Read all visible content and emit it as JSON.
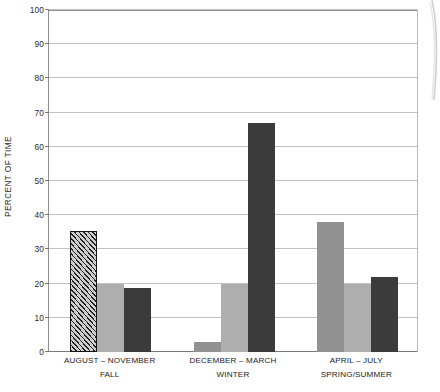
{
  "chart_data": {
    "type": "bar",
    "title": "",
    "subtitle": "",
    "xlabel": "",
    "ylabel": "PERCENT OF TIME",
    "ylim": [
      0,
      100
    ],
    "yticks": [
      0,
      10,
      20,
      30,
      40,
      50,
      60,
      70,
      80,
      90,
      100
    ],
    "ytick_labels": [
      "0",
      "10",
      "20",
      "30",
      "40",
      "50",
      "60",
      "70",
      "80",
      "90",
      "100"
    ],
    "grid": true,
    "legend": "none",
    "categories": [
      "AUGUST – NOVEMBER",
      "DECEMBER – MARCH",
      "APRIL – JULY"
    ],
    "category_sublabels": [
      "FALL",
      "WINTER",
      "SPRING/SUMMER"
    ],
    "series": [
      {
        "name": "series-1",
        "values": [
          35.5,
          3.0,
          38.0
        ],
        "styles": [
          "hatched",
          "medium-gray",
          "medium-gray"
        ],
        "colors": [
          "#b3b3b3",
          "#919191",
          "#919191"
        ]
      },
      {
        "name": "series-2",
        "values": [
          20.0,
          20.0,
          20.0
        ],
        "styles": [
          "light-gray",
          "light-gray",
          "light-gray"
        ],
        "colors": [
          "#aeaeae",
          "#aeaeae",
          "#aeaeae"
        ]
      },
      {
        "name": "series-3",
        "values": [
          18.7,
          67.0,
          22.0
        ],
        "styles": [
          "dark-gray",
          "dark-gray",
          "dark-gray"
        ],
        "colors": [
          "#3b3b3b",
          "#3b3b3b",
          "#3b3b3b"
        ]
      }
    ]
  },
  "axis": {
    "y_title": "PERCENT OF TIME"
  },
  "colors": {
    "hatch_fill": "#b3b3b3",
    "hatch_border": "#161616",
    "medium_gray": "#919191",
    "light_gray": "#aeaeae",
    "dark_gray": "#3b3b3b",
    "gridline": "#c2c2c2",
    "axis_line": "#8f8f8f",
    "text": "#222222",
    "background": "#ffffff"
  }
}
